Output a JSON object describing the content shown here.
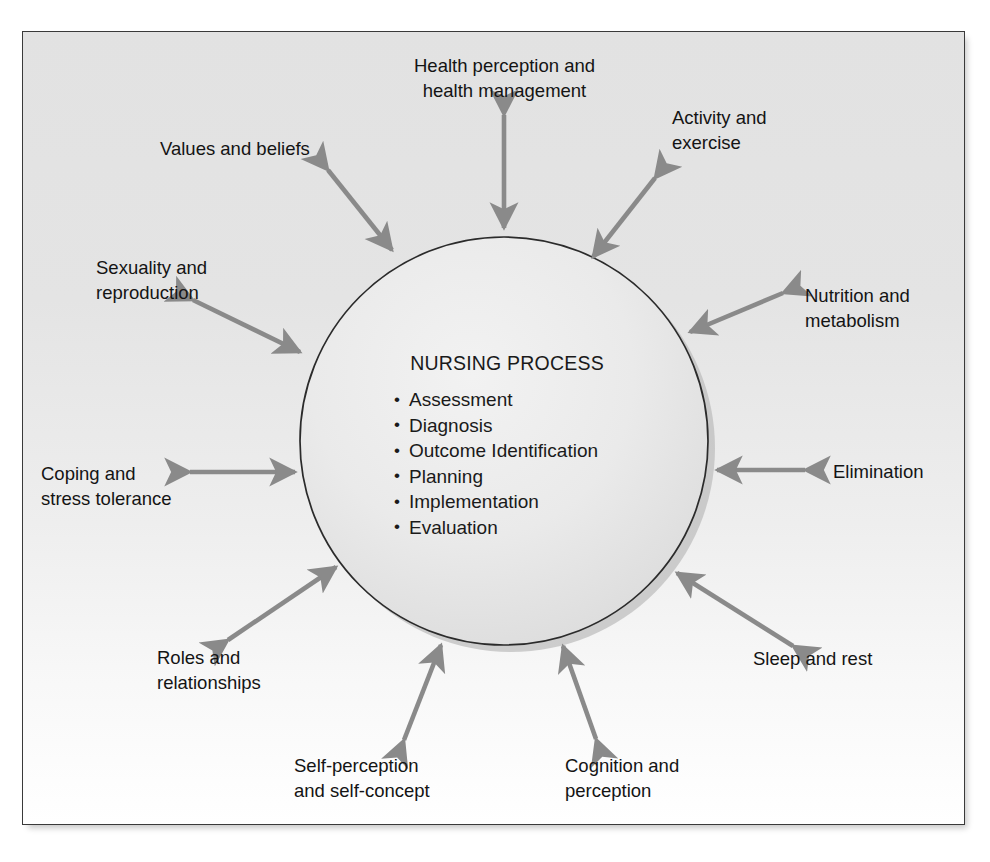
{
  "figure": {
    "kind": "concept-diagram",
    "center": {
      "title": "NURSING PROCESS",
      "steps": [
        "Assessment",
        "Diagnosis",
        "Outcome Identification",
        "Planning",
        "Implementation",
        "Evaluation"
      ]
    },
    "spokes": [
      {
        "id": "health-perception",
        "label": "Health perception and\nhealth management"
      },
      {
        "id": "activity-exercise",
        "label": "Activity and\nexercise"
      },
      {
        "id": "nutrition-metabolism",
        "label": "Nutrition and\nmetabolism"
      },
      {
        "id": "elimination",
        "label": "Elimination"
      },
      {
        "id": "sleep-rest",
        "label": "Sleep and rest"
      },
      {
        "id": "cognition-perception",
        "label": "Cognition and\nperception"
      },
      {
        "id": "self-perception",
        "label": "Self-perception\nand self-concept"
      },
      {
        "id": "roles-relationships",
        "label": "Roles and\nrelationships"
      },
      {
        "id": "coping-stress",
        "label": "Coping and\nstress tolerance"
      },
      {
        "id": "sexuality-reproduction",
        "label": "Sexuality and\nreproduction"
      },
      {
        "id": "values-beliefs",
        "label": "Values and beliefs"
      }
    ],
    "colors": {
      "arrow": "#8a8a8a",
      "circle_fill": "#e9e9e9",
      "circle_stroke": "#2b2b2b",
      "circle_shadow": "#b5b5b5",
      "panel_border": "#3a3a3a",
      "text": "#141414"
    }
  }
}
